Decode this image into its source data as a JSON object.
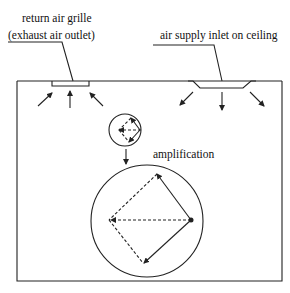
{
  "diagram": {
    "labels": {
      "return_grille_line1": "return air grille",
      "return_grille_line2": "(exhaust air outlet)",
      "supply_inlet": "air supply inlet on ceiling",
      "amplification": "amplification"
    },
    "colors": {
      "line": "#222222",
      "background": "#ffffff"
    }
  }
}
